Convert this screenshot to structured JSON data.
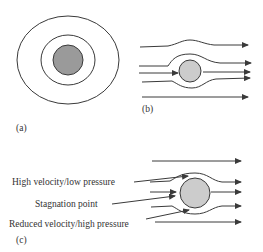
{
  "figure": {
    "panels": {
      "a": {
        "label": "(a)"
      },
      "b": {
        "label": "(b)"
      },
      "c": {
        "label": "(c)",
        "annotations": {
          "high_velocity": "High velocity/low pressure",
          "stagnation": "Stagnation point",
          "reduced_velocity": "Reduced velocity/high pressure"
        }
      }
    },
    "colors": {
      "line": "#3a3a3a",
      "cylinder_fill_a": "#9a9a9a",
      "cylinder_fill": "#cccccc"
    }
  }
}
